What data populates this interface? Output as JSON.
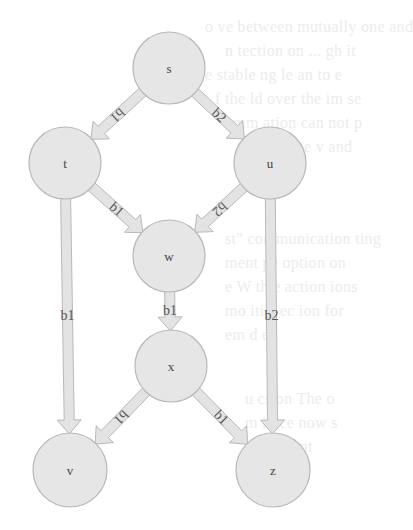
{
  "diagram": {
    "type": "directed-graph",
    "nodes": [
      {
        "id": "s",
        "label": "s",
        "cx": 169,
        "cy": 68,
        "r": 36
      },
      {
        "id": "t",
        "label": "t",
        "cx": 65,
        "cy": 163,
        "r": 36
      },
      {
        "id": "u",
        "label": "u",
        "cx": 270,
        "cy": 163,
        "r": 36
      },
      {
        "id": "w",
        "label": "w",
        "cx": 169,
        "cy": 256,
        "r": 36
      },
      {
        "id": "x",
        "label": "x",
        "cx": 171,
        "cy": 366,
        "r": 36
      },
      {
        "id": "v",
        "label": "v",
        "cx": 70,
        "cy": 470,
        "r": 37
      },
      {
        "id": "z",
        "label": "z",
        "cx": 273,
        "cy": 470,
        "r": 37
      }
    ],
    "edges": [
      {
        "from": "s",
        "to": "t",
        "label": "b1"
      },
      {
        "from": "s",
        "to": "u",
        "label": "b2"
      },
      {
        "from": "t",
        "to": "w",
        "label": "b1"
      },
      {
        "from": "u",
        "to": "w",
        "label": "b2"
      },
      {
        "from": "t",
        "to": "v",
        "label": "b1"
      },
      {
        "from": "u",
        "to": "z",
        "label": "b2"
      },
      {
        "from": "w",
        "to": "x",
        "label": "b1"
      },
      {
        "from": "x",
        "to": "v",
        "label": "b1"
      },
      {
        "from": "x",
        "to": "z",
        "label": "b1"
      }
    ],
    "colors": {
      "node_fill": "#e6e6e6",
      "node_stroke": "#b8b8b8",
      "edge_fill": "#e3e3e3",
      "edge_stroke": "#b9b9b9",
      "text": "#444444"
    }
  },
  "background_showthrough": [
    {
      "text": "o  ve between mutually one and",
      "x": 205,
      "y": 18
    },
    {
      "text": "n  tection on ...  gh  it",
      "x": 225,
      "y": 42
    },
    {
      "text": "e  stable  ng  le  an  to  e",
      "x": 205,
      "y": 66
    },
    {
      "text": "f  the  ld  over the  im  se",
      "x": 215,
      "y": 90
    },
    {
      "text": "  omm  ation can not  p",
      "x": 225,
      "y": 114
    },
    {
      "text": "e  ponce  he  v  and",
      "x": 240,
      "y": 138
    },
    {
      "text": "st\"  communication  ting",
      "x": 225,
      "y": 230
    },
    {
      "text": "  ment  pe  option  on",
      "x": 225,
      "y": 254
    },
    {
      "text": "e  W  th  e  action  ions",
      "x": 225,
      "y": 278
    },
    {
      "text": "  mo  iti  s  ec  ion  for",
      "x": 225,
      "y": 302
    },
    {
      "text": "  em  d  es",
      "x": 225,
      "y": 326
    },
    {
      "text": "  u  cs  on  The  o",
      "x": 245,
      "y": 390
    },
    {
      "text": "  m  in  ce  now  s",
      "x": 245,
      "y": 414
    },
    {
      "text": "  ors  re  p  nt",
      "x": 245,
      "y": 438
    },
    {
      "text": "  or  w  p",
      "x": 255,
      "y": 462
    }
  ]
}
